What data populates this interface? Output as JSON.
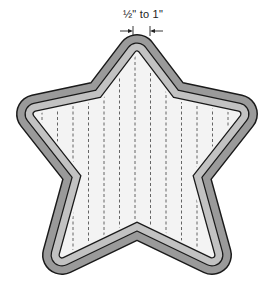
{
  "diagram": {
    "dimension_label": "½\" to 1\"",
    "colors": {
      "outer_band": "#9a9a9a",
      "inner_band": "#c2c2c2",
      "outline": "#1a1a1a",
      "interior": "#f3f3f3",
      "quilting_lines": "#555555",
      "background": "#ffffff"
    },
    "quilting_line_count": 13
  }
}
